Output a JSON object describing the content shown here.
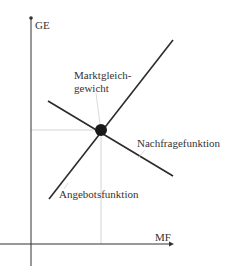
{
  "diagram": {
    "axes": {
      "y_label": "GE",
      "x_label": "MF"
    },
    "curves": {
      "supply_label": "Angebotsfunktion",
      "demand_label": "Nachfragefunktion"
    },
    "equilibrium": {
      "label_line1": "Marktgleich-",
      "label_line2": "gewicht"
    },
    "colors": {
      "axis": "#333333",
      "curve": "#2b2b2b",
      "guide": "#cfcfcf",
      "point": "#1a1a1a",
      "text": "#333333"
    }
  }
}
